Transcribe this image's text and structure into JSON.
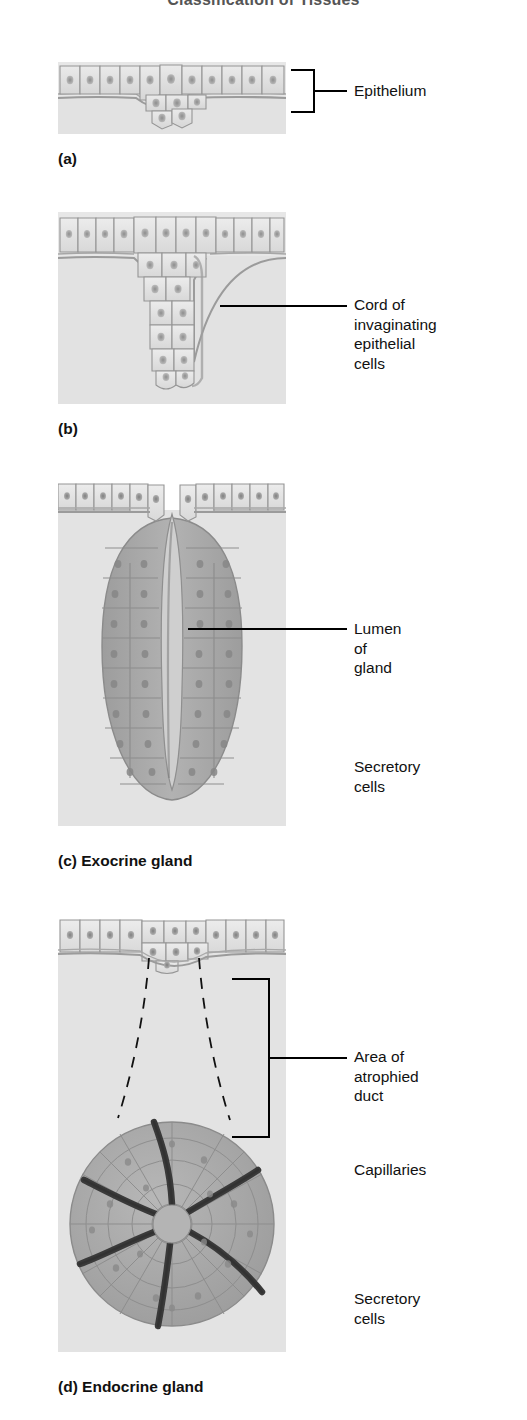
{
  "running_head": "Classification of Tissues",
  "panels": [
    {
      "id": "a",
      "caption": "(a)",
      "art_name": "epithelium-invagination-start",
      "labels": [
        {
          "name": "epithelium",
          "text": "Epithelium",
          "style": "bracket"
        }
      ]
    },
    {
      "id": "b",
      "caption": "(b)",
      "art_name": "epithelial-cord-invagination",
      "labels": [
        {
          "name": "cord-of-invaginating-epithelial-cells",
          "text": "Cord of\ninvaginating\nepithelial cells",
          "style": "leader"
        }
      ]
    },
    {
      "id": "c",
      "caption": "(c) Exocrine gland",
      "art_name": "exocrine-gland-with-duct",
      "labels": [
        {
          "name": "lumen-of-gland",
          "text": "Lumen of gland",
          "style": "leader"
        },
        {
          "name": "secretory-cells-exocrine",
          "text": "Secretory cells",
          "style": "leader-fork"
        }
      ]
    },
    {
      "id": "d",
      "caption": "(d) Endocrine gland",
      "art_name": "endocrine-gland-with-capillaries",
      "labels": [
        {
          "name": "area-of-atrophied-duct",
          "text": "Area of\natrophied duct",
          "style": "bracket"
        },
        {
          "name": "capillaries",
          "text": "Capillaries",
          "style": "leader-fork"
        },
        {
          "name": "secretory-cells-endocrine",
          "text": "Secretory cells",
          "style": "leader"
        }
      ]
    }
  ],
  "colors": {
    "art_background": "#e5e5e5",
    "epithelial_cell_fill": "#dedede",
    "secretory_cell_fill": "#a9a9a9",
    "capillary": "#3a3a3a",
    "cell_outline": "#8e8e8e",
    "nucleus": "#9a9a9a",
    "leader_line": "#000000",
    "text": "#111111"
  }
}
